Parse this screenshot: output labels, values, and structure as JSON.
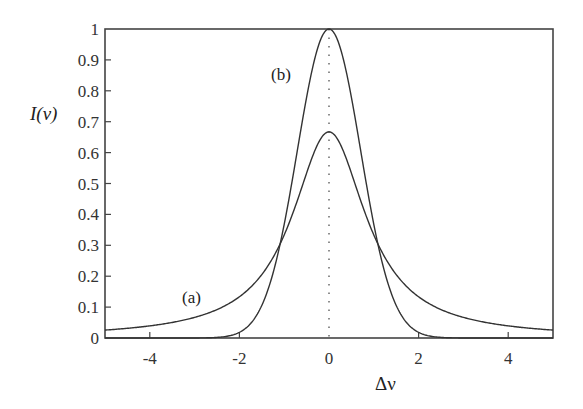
{
  "chart_data": {
    "type": "line",
    "title": "",
    "xlabel": "Δν",
    "ylabel": "I(ν)",
    "xlim": [
      -5,
      5
    ],
    "ylim": [
      0,
      1
    ],
    "xticks": [
      -4,
      -2,
      0,
      2,
      4
    ],
    "xtick_labels": [
      "-4",
      "-2",
      "0",
      "2",
      "4"
    ],
    "yticks": [
      0,
      0.1,
      0.2,
      0.3,
      0.4,
      0.5,
      0.6,
      0.7,
      0.8,
      0.9,
      1
    ],
    "ytick_labels": [
      "0",
      "0.1",
      "0.2",
      "0.3",
      "0.4",
      "0.5",
      "0.6",
      "0.7",
      "0.8",
      "0.9",
      "1"
    ],
    "grid": false,
    "legend": "none",
    "x": [
      -5,
      -4,
      -3,
      -2.5,
      -2,
      -1.5,
      -1.1,
      -1,
      -0.75,
      -0.5,
      -0.25,
      0,
      0.25,
      0.5,
      0.75,
      1,
      1.1,
      1.5,
      2,
      2.5,
      3,
      4,
      5
    ],
    "series": [
      {
        "name": "(a)",
        "description": "Lorentzian profile, peak 0.67 at Δν=0",
        "values": [
          0.026,
          0.039,
          0.067,
          0.092,
          0.133,
          0.205,
          0.302,
          0.333,
          0.427,
          0.533,
          0.627,
          0.667,
          0.627,
          0.533,
          0.427,
          0.333,
          0.302,
          0.205,
          0.133,
          0.092,
          0.067,
          0.039,
          0.026
        ]
      },
      {
        "name": "(b)",
        "description": "Gaussian profile, peak 1.0 at Δν=0",
        "values": [
          0.0,
          0.0,
          0.0001,
          0.002,
          0.018,
          0.105,
          0.298,
          0.368,
          0.57,
          0.779,
          0.939,
          1.0,
          0.939,
          0.779,
          0.57,
          0.368,
          0.298,
          0.105,
          0.018,
          0.002,
          0.0001,
          0.0,
          0.0
        ]
      }
    ],
    "annotations": [
      {
        "text": "(a)",
        "x": -3.2,
        "y": 0.12,
        "refers_to": "Lorentzian curve"
      },
      {
        "text": "(b)",
        "x": -0.55,
        "y": 0.82,
        "refers_to": "Gaussian curve"
      },
      {
        "text": "dotted vertical line at Δν = 0",
        "x": 0
      }
    ]
  },
  "labels": {
    "xlabel": "Δν",
    "ylabel": "I(ν)",
    "curve_a": "(a)",
    "curve_b": "(b)"
  }
}
